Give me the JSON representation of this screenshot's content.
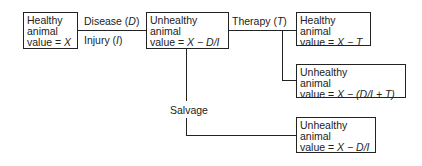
{
  "nodes": {
    "healthy_initial": {
      "line1": "Healthy",
      "line2": "animal",
      "line3_prefix": "value = ",
      "line3_expr": "X"
    },
    "unhealthy_after_event": {
      "line1": "Unhealthy",
      "line2": "animal",
      "line3_prefix": "value = ",
      "line3_expr": "X − D/I"
    },
    "healthy_after_therapy": {
      "line1": "Healthy",
      "line2": "animal",
      "line3_prefix": "value = ",
      "line3_expr": "X − T"
    },
    "unhealthy_after_therapy": {
      "line1": "Unhealthy",
      "line2": "animal",
      "line3_prefix": "value = ",
      "line3_expr": "X − (D/I + T)"
    },
    "unhealthy_salvage": {
      "line1": "Unhealthy",
      "line2": "animal",
      "line3_prefix": "value = ",
      "line3_expr": "X − D/I"
    }
  },
  "edges": {
    "disease": {
      "text": "Disease (",
      "var": "D",
      "close": ")"
    },
    "injury": {
      "text": "Injury (",
      "var": "I",
      "close": ")"
    },
    "therapy": {
      "text": "Therapy (",
      "var": "T",
      "close": ")"
    },
    "salvage": {
      "text": "Salvage"
    }
  }
}
